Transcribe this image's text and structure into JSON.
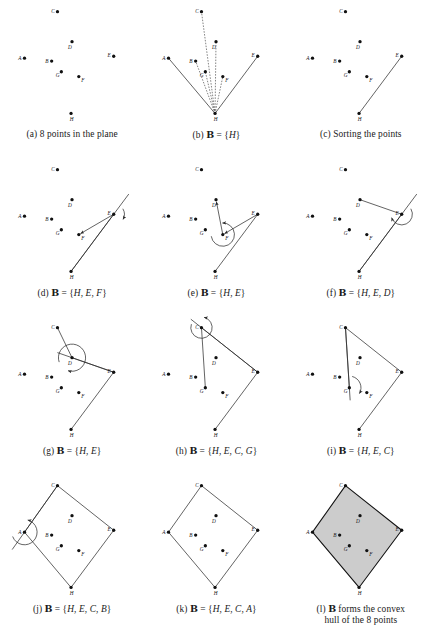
{
  "figure": {
    "point_labels": [
      "A",
      "B",
      "C",
      "D",
      "E",
      "F",
      "G",
      "H"
    ],
    "points": {
      "A": {
        "x": 18,
        "y": 60,
        "label": "A",
        "label_dx": -6.5,
        "label_dy": 1.6
      },
      "B": {
        "x": 46,
        "y": 63,
        "label": "B",
        "label_dx": -6.5,
        "label_dy": 1.6
      },
      "C": {
        "x": 52,
        "y": 12,
        "label": "C",
        "label_dx": -6.5,
        "label_dy": 1.2
      },
      "D": {
        "x": 67,
        "y": 43,
        "label": "D",
        "label_dx": -4.0,
        "label_dy": 7.4
      },
      "E": {
        "x": 110,
        "y": 58,
        "label": "E",
        "label_dx": -6.5,
        "label_dy": 0.8
      },
      "F": {
        "x": 74,
        "y": 79,
        "label": "F",
        "label_dx": 2.6,
        "label_dy": 5.4
      },
      "G": {
        "x": 56,
        "y": 74,
        "label": "G",
        "label_dx": -5.8,
        "label_dy": 5.0
      },
      "H": {
        "x": 66,
        "y": 117,
        "label": "H",
        "label_dx": -1.2,
        "label_dy": 8.0
      }
    },
    "style": {
      "dot_radius": 1.7,
      "dot_color": "#111111",
      "line_color": "#2a2a2a",
      "line_width": 0.75,
      "dashed_color": "#555555",
      "hull_fill": "#cccccc",
      "hull_stroke": "#111111",
      "background": "#ffffff"
    },
    "panels": [
      {
        "id": "a",
        "name": "panel-8-points",
        "caption_parts": [
          {
            "t": "(a) 8 points in the plane",
            "s": "plain"
          }
        ],
        "dots": [
          "A",
          "B",
          "C",
          "D",
          "E",
          "F",
          "G",
          "H"
        ],
        "solid_lines": [],
        "dashed_lines": [],
        "rays": [],
        "arcs": [],
        "arrows": [],
        "hull": null
      },
      {
        "id": "b",
        "name": "panel-b-init",
        "caption_parts": [
          {
            "t": "(b) ",
            "s": "plain"
          },
          {
            "t": "B",
            "s": "bb"
          },
          {
            "t": " = {",
            "s": "plain"
          },
          {
            "t": "H",
            "s": "it"
          },
          {
            "t": "}",
            "s": "plain"
          }
        ],
        "dots": [
          "A",
          "B",
          "C",
          "D",
          "E",
          "F",
          "G",
          "H"
        ],
        "solid_lines": [
          [
            "H",
            "A"
          ],
          [
            "H",
            "E"
          ]
        ],
        "dashed_lines": [
          [
            "H",
            "B"
          ],
          [
            "H",
            "C"
          ],
          [
            "H",
            "D"
          ],
          [
            "H",
            "F"
          ],
          [
            "H",
            "G"
          ]
        ],
        "rays": [],
        "arcs": [],
        "arrows": [],
        "hull": null
      },
      {
        "id": "c",
        "name": "panel-c-sorting",
        "caption_parts": [
          {
            "t": "(c) Sorting the points",
            "s": "plain"
          }
        ],
        "dots": [
          "A",
          "B",
          "C",
          "D",
          "E",
          "F",
          "G",
          "H"
        ],
        "solid_lines": [
          [
            "H",
            "E"
          ]
        ],
        "dashed_lines": [],
        "rays": [],
        "arcs": [],
        "arrows": [],
        "hull": null
      },
      {
        "id": "d",
        "name": "panel-d-hef",
        "caption_parts": [
          {
            "t": "(d) ",
            "s": "plain"
          },
          {
            "t": "B",
            "s": "bb"
          },
          {
            "t": " = {",
            "s": "plain"
          },
          {
            "t": "H, E, F",
            "s": "it"
          },
          {
            "t": "}",
            "s": "plain"
          }
        ],
        "dots": [
          "A",
          "B",
          "C",
          "D",
          "E",
          "F",
          "G",
          "H"
        ],
        "solid_lines": [
          [
            "H",
            "E"
          ],
          [
            "E",
            "F"
          ]
        ],
        "dashed_lines": [],
        "rays": [
          {
            "from": "H",
            "through": "E",
            "extend": 26
          }
        ],
        "arcs": [
          {
            "at": "E",
            "from_deg": 31,
            "to_deg": 331,
            "r": 11,
            "sweep": 1,
            "arrow_end": true
          }
        ],
        "arrows": [
          {
            "from": "E",
            "to": "F"
          }
        ],
        "hull": null
      },
      {
        "id": "e",
        "name": "panel-e-he",
        "caption_parts": [
          {
            "t": "(e) ",
            "s": "plain"
          },
          {
            "t": "B",
            "s": "bb"
          },
          {
            "t": " = {",
            "s": "plain"
          },
          {
            "t": "H, E",
            "s": "it"
          },
          {
            "t": "}",
            "s": "plain"
          }
        ],
        "dots": [
          "A",
          "B",
          "C",
          "D",
          "E",
          "F",
          "G",
          "H"
        ],
        "solid_lines": [
          [
            "H",
            "E"
          ],
          [
            "E",
            "F"
          ],
          [
            "F",
            "D"
          ]
        ],
        "dashed_lines": [],
        "rays": [],
        "arcs": [
          {
            "at": "F",
            "from_deg": 188,
            "to_deg": 92,
            "r": 12,
            "sweep": 0,
            "arrow_end": true
          }
        ],
        "arrows": [
          {
            "from": "E",
            "to": "F"
          },
          {
            "from": "F",
            "to": "D"
          }
        ],
        "hull": null
      },
      {
        "id": "f",
        "name": "panel-f-hed",
        "caption_parts": [
          {
            "t": "(f) ",
            "s": "plain"
          },
          {
            "t": "B",
            "s": "bb"
          },
          {
            "t": " = {",
            "s": "plain"
          },
          {
            "t": "H, E, D",
            "s": "it"
          },
          {
            "t": "}",
            "s": "plain"
          }
        ],
        "dots": [
          "A",
          "B",
          "C",
          "D",
          "E",
          "F",
          "G",
          "H"
        ],
        "solid_lines": [
          [
            "H",
            "E"
          ],
          [
            "E",
            "D"
          ]
        ],
        "dashed_lines": [],
        "rays": [
          {
            "from": "H",
            "through": "E",
            "extend": 26
          }
        ],
        "arcs": [
          {
            "at": "E",
            "from_deg": 31,
            "to_deg": 199,
            "r": 11,
            "sweep": 1,
            "arrow_end": true
          }
        ],
        "arrows": [],
        "hull": null
      },
      {
        "id": "g",
        "name": "panel-g-he",
        "caption_parts": [
          {
            "t": "(g) ",
            "s": "plain"
          },
          {
            "t": "B",
            "s": "bb"
          },
          {
            "t": " = {",
            "s": "plain"
          },
          {
            "t": "H, E",
            "s": "it"
          },
          {
            "t": "}",
            "s": "plain"
          }
        ],
        "dots": [
          "A",
          "B",
          "C",
          "D",
          "E",
          "F",
          "G",
          "H"
        ],
        "solid_lines": [
          [
            "H",
            "E"
          ],
          [
            "E",
            "D"
          ],
          [
            "D",
            "C"
          ]
        ],
        "dashed_lines": [],
        "rays": [
          {
            "from": "E",
            "through": "D",
            "extend": 16
          }
        ],
        "arcs": [
          {
            "at": "D",
            "from_deg": 199,
            "to_deg": 253,
            "r": 14,
            "sweep": 1,
            "arrow_end": true
          }
        ],
        "arrows": [],
        "hull": null
      },
      {
        "id": "h",
        "name": "panel-h-hecg",
        "caption_parts": [
          {
            "t": "(h) ",
            "s": "plain"
          },
          {
            "t": "B",
            "s": "bb"
          },
          {
            "t": " = {",
            "s": "plain"
          },
          {
            "t": "H, E, C, G",
            "s": "it"
          },
          {
            "t": "}",
            "s": "plain"
          }
        ],
        "dots": [
          "A",
          "B",
          "C",
          "D",
          "E",
          "F",
          "G",
          "H"
        ],
        "solid_lines": [
          [
            "H",
            "E"
          ],
          [
            "E",
            "C"
          ],
          [
            "C",
            "G"
          ]
        ],
        "dashed_lines": [],
        "rays": [
          {
            "from": "E",
            "through": "C",
            "extend": 14
          }
        ],
        "arcs": [
          {
            "at": "C",
            "from_deg": 161,
            "to_deg": 76,
            "r": 11,
            "sweep": 0,
            "arrow_end": true
          }
        ],
        "arrows": [],
        "hull": null
      },
      {
        "id": "i",
        "name": "panel-i-hec",
        "caption_parts": [
          {
            "t": "(i) ",
            "s": "plain"
          },
          {
            "t": "B",
            "s": "bb"
          },
          {
            "t": " = {",
            "s": "plain"
          },
          {
            "t": "H, E, C",
            "s": "it"
          },
          {
            "t": "}",
            "s": "plain"
          }
        ],
        "dots": [
          "A",
          "B",
          "C",
          "D",
          "E",
          "F",
          "G",
          "H"
        ],
        "solid_lines": [
          [
            "H",
            "E"
          ],
          [
            "E",
            "C"
          ],
          [
            "C",
            "G"
          ]
        ],
        "dashed_lines": [],
        "rays": [
          {
            "from": "C",
            "through": "G",
            "extend": 13
          }
        ],
        "arcs": [
          {
            "at": "G",
            "from_deg": 76,
            "to_deg": 330,
            "r": 12,
            "sweep": 1,
            "arrow_end": true
          }
        ],
        "arrows": [],
        "hull": null
      },
      {
        "id": "j",
        "name": "panel-j-hecb",
        "caption_parts": [
          {
            "t": "(j) ",
            "s": "plain"
          },
          {
            "t": "B",
            "s": "bb"
          },
          {
            "t": " = {",
            "s": "plain"
          },
          {
            "t": "H, E, C, B",
            "s": "it"
          },
          {
            "t": "}",
            "s": "plain"
          }
        ],
        "dots": [
          "A",
          "B",
          "C",
          "D",
          "E",
          "F",
          "G",
          "H"
        ],
        "solid_lines": [
          [
            "H",
            "E"
          ],
          [
            "E",
            "C"
          ],
          [
            "C",
            "A"
          ],
          [
            "A",
            "H"
          ]
        ],
        "dashed_lines": [],
        "rays": [
          {
            "from": "C",
            "through": "A",
            "extend": 22
          }
        ],
        "arcs": [
          {
            "at": "A",
            "from_deg": 200,
            "to_deg": 75,
            "r": 13,
            "sweep": 0,
            "arrow_end": true
          }
        ],
        "arrows": [],
        "hull": null
      },
      {
        "id": "k",
        "name": "panel-k-heca",
        "caption_parts": [
          {
            "t": "(k) ",
            "s": "plain"
          },
          {
            "t": "B",
            "s": "bb"
          },
          {
            "t": " = {",
            "s": "plain"
          },
          {
            "t": "H, E, C, A",
            "s": "it"
          },
          {
            "t": "}",
            "s": "plain"
          }
        ],
        "dots": [
          "A",
          "B",
          "C",
          "D",
          "E",
          "F",
          "G",
          "H"
        ],
        "solid_lines": [
          [
            "H",
            "E"
          ],
          [
            "E",
            "C"
          ],
          [
            "C",
            "A"
          ],
          [
            "A",
            "H"
          ]
        ],
        "dashed_lines": [],
        "rays": [],
        "arcs": [],
        "arrows": [],
        "hull": null
      },
      {
        "id": "l",
        "name": "panel-l-convex-hull",
        "caption_parts": [
          {
            "t": "(l) ",
            "s": "plain"
          },
          {
            "t": "B",
            "s": "bb"
          },
          {
            "t": " forms the convex\nhull of the 8 points",
            "s": "plain"
          }
        ],
        "dots": [
          "A",
          "B",
          "C",
          "D",
          "E",
          "F",
          "G",
          "H"
        ],
        "solid_lines": [],
        "dashed_lines": [],
        "rays": [],
        "arcs": [],
        "arrows": [],
        "hull": [
          "H",
          "E",
          "C",
          "A"
        ]
      }
    ]
  }
}
